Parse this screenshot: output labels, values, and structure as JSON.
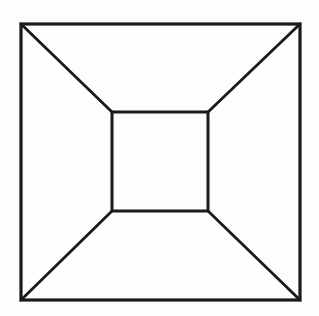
{
  "diagram": {
    "stroke_color": "#1a1a1a",
    "background_color": "#fdfdfd",
    "outer_square": {
      "x1": 21,
      "y1": 24,
      "x2": 300,
      "y2": 300
    },
    "inner_square": {
      "x1": 112,
      "y1": 112,
      "x2": 208,
      "y2": 211
    }
  }
}
